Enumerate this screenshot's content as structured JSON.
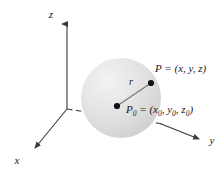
{
  "figure": {
    "background_color": "#ffffff",
    "width": 223,
    "height": 171,
    "axes": {
      "z_label": "z",
      "x_label": "x",
      "y_label": "y",
      "origin": [
        67,
        109
      ],
      "line_color": "#3a3a3a"
    },
    "sphere": {
      "center": [
        121,
        98
      ],
      "radius": 40,
      "fill_light": "#ececec",
      "fill_dark": "#d2d2d2"
    },
    "points": [
      {
        "name": "P",
        "label_main": "P",
        "label_equals": " = (",
        "label_coords": "x, y, z",
        "label_close": ")",
        "label_full": "P = (x, y, z)",
        "marker": [
          151,
          83
        ],
        "marker_color": "#111111"
      },
      {
        "name": "P0",
        "label_main": "P",
        "label_sub": "0",
        "label_equals": " = (",
        "label_coords_x": "x",
        "label_coords_x_sub": "0",
        "label_coords_y": "y",
        "label_coords_y_sub": "0",
        "label_coords_z": "z",
        "label_coords_z_sub": "0",
        "label_close": ")",
        "label_full": "P0 = (x0, y0, z0)",
        "marker": [
          117,
          106
        ],
        "marker_color": "#111111"
      }
    ],
    "radius_segment": {
      "label": "r",
      "from": [
        117,
        106
      ],
      "to": [
        151,
        83
      ],
      "color": "#6b6b6b"
    }
  }
}
